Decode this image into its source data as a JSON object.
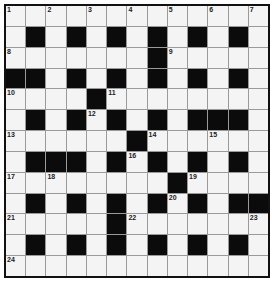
{
  "puzzle": {
    "rows": 13,
    "cols": 13,
    "colors": {
      "block": "#0b0b0b",
      "cell": "#f4f4f4",
      "gridline": "#9a9a9a",
      "border": "#111111"
    },
    "grid": [
      ".............",
      ".#.#.#.#.#.#.",
      ".......#.....",
      "##.#.#.#.#.#.",
      "....#........",
      ".#.#.#.#.###.",
      "......#......",
      ".###.#.#.#.#.",
      "........#....",
      ".#.#.#.#.#.##",
      ".....#.......",
      ".#.#.#.#.#.#.",
      "............."
    ],
    "numbers": [
      {
        "r": 0,
        "c": 0,
        "n": "1"
      },
      {
        "r": 0,
        "c": 2,
        "n": "2"
      },
      {
        "r": 0,
        "c": 4,
        "n": "3"
      },
      {
        "r": 0,
        "c": 6,
        "n": "4"
      },
      {
        "r": 0,
        "c": 8,
        "n": "5"
      },
      {
        "r": 0,
        "c": 10,
        "n": "6"
      },
      {
        "r": 0,
        "c": 12,
        "n": "7"
      },
      {
        "r": 2,
        "c": 0,
        "n": "8"
      },
      {
        "r": 2,
        "c": 8,
        "n": "9"
      },
      {
        "r": 4,
        "c": 0,
        "n": "10"
      },
      {
        "r": 4,
        "c": 5,
        "n": "11"
      },
      {
        "r": 5,
        "c": 4,
        "n": "12"
      },
      {
        "r": 6,
        "c": 0,
        "n": "13"
      },
      {
        "r": 6,
        "c": 7,
        "n": "14"
      },
      {
        "r": 6,
        "c": 10,
        "n": "15"
      },
      {
        "r": 7,
        "c": 6,
        "n": "16"
      },
      {
        "r": 8,
        "c": 0,
        "n": "17"
      },
      {
        "r": 8,
        "c": 2,
        "n": "18"
      },
      {
        "r": 8,
        "c": 9,
        "n": "19"
      },
      {
        "r": 9,
        "c": 8,
        "n": "20"
      },
      {
        "r": 10,
        "c": 0,
        "n": "21"
      },
      {
        "r": 10,
        "c": 6,
        "n": "22"
      },
      {
        "r": 10,
        "c": 12,
        "n": "23"
      },
      {
        "r": 12,
        "c": 0,
        "n": "24"
      }
    ]
  }
}
